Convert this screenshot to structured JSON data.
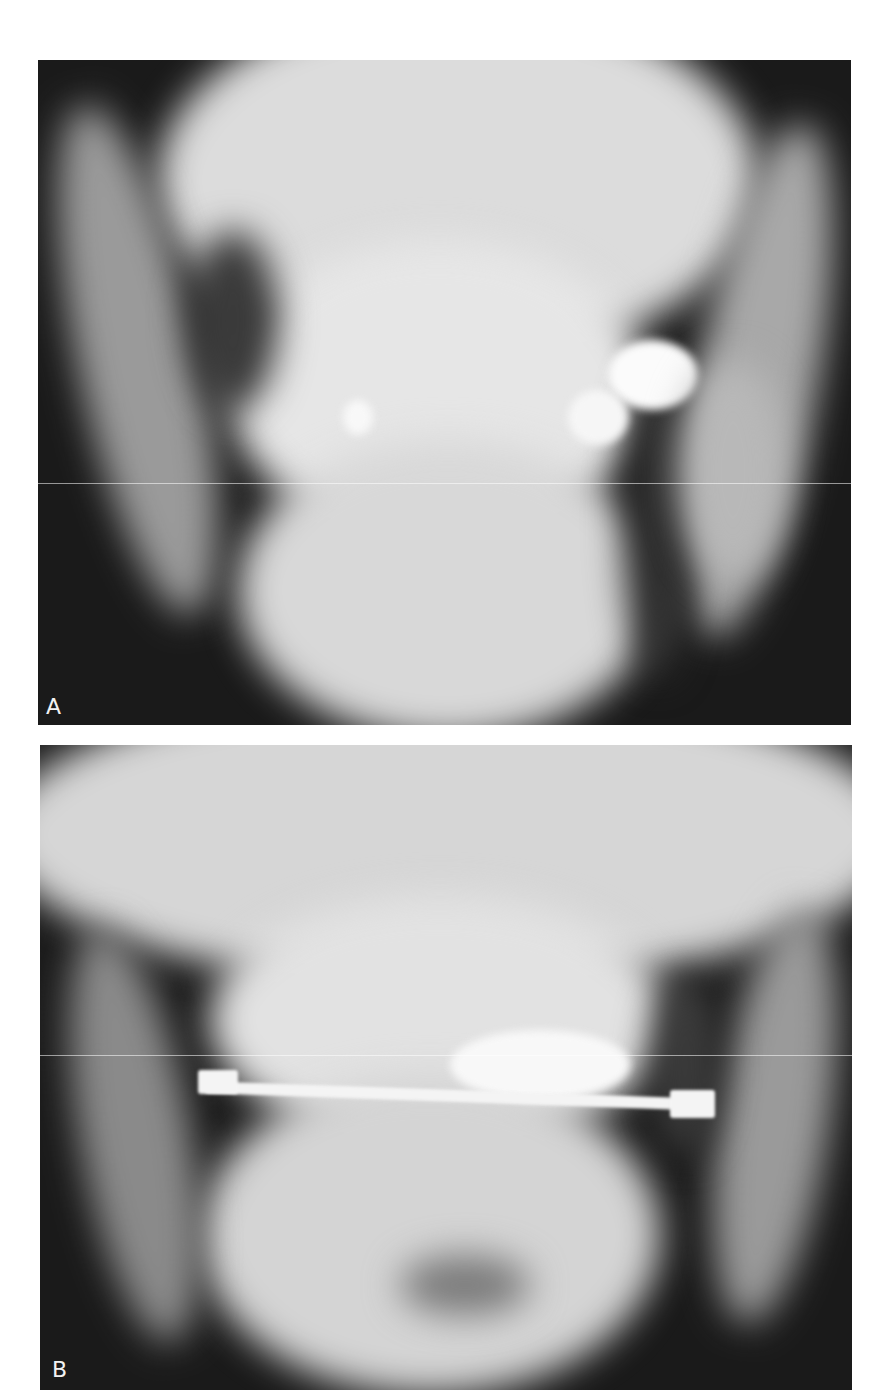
{
  "figure": {
    "panels": [
      {
        "id": "A",
        "label": "A",
        "description": "Frontal (posteroanterior) radiograph of the mandible and maxilla showing a displaced mandibular fracture"
      },
      {
        "id": "B",
        "label": "B",
        "description": "Follow-up frontal radiograph showing interdental arch bar fixation across the dentition"
      }
    ],
    "colors": {
      "background": "#ffffff",
      "film_dark": "#1a1a1a",
      "bone_light": "#e8e8e8"
    }
  }
}
